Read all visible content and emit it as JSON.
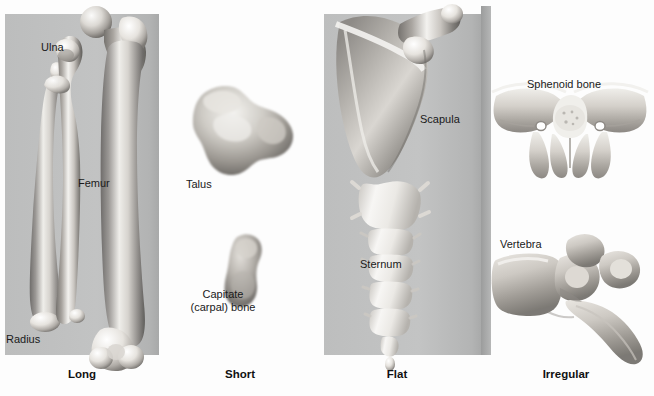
{
  "figure": {
    "background_color": "#ffffff",
    "panel_backdrop_color": "#bfc0c0"
  },
  "categories": [
    {
      "id": "long",
      "label": "Long",
      "x": 82,
      "y": 375
    },
    {
      "id": "short",
      "label": "Short",
      "x": 240,
      "y": 375
    },
    {
      "id": "flat",
      "label": "Flat",
      "x": 397,
      "y": 375
    },
    {
      "id": "irregular",
      "label": "Irregular",
      "x": 566,
      "y": 375
    }
  ],
  "panels": [
    {
      "id": "long",
      "category": "Long",
      "has_gray_backdrop": true,
      "bones": [
        {
          "id": "ulna",
          "label": "Ulna",
          "label_x": 41,
          "label_y": 41
        },
        {
          "id": "femur",
          "label": "Femur",
          "label_x": 78,
          "label_y": 177
        },
        {
          "id": "radius",
          "label": "Radius",
          "label_x": 6,
          "label_y": 333
        }
      ]
    },
    {
      "id": "short",
      "category": "Short",
      "has_gray_backdrop": false,
      "bones": [
        {
          "id": "talus",
          "label": "Talus",
          "label_x": 186,
          "label_y": 178
        },
        {
          "id": "capitate",
          "label_line1": "Capitate",
          "label_line2": "(carpal) bone",
          "label": "Capitate (carpal) bone",
          "label_x": 186,
          "label_y": 288
        }
      ]
    },
    {
      "id": "flat",
      "category": "Flat",
      "has_gray_backdrop": true,
      "bones": [
        {
          "id": "scapula",
          "label": "Scapula",
          "label_x": 420,
          "label_y": 113
        },
        {
          "id": "sternum",
          "label": "Sternum",
          "label_x": 360,
          "label_y": 258
        }
      ]
    },
    {
      "id": "irregular",
      "category": "Irregular",
      "has_gray_backdrop": false,
      "bones": [
        {
          "id": "sphenoid",
          "label": "Sphenoid bone",
          "label_x": 527,
          "label_y": 78
        },
        {
          "id": "vertebra",
          "label": "Vertebra",
          "label_x": 500,
          "label_y": 238
        }
      ]
    }
  ]
}
